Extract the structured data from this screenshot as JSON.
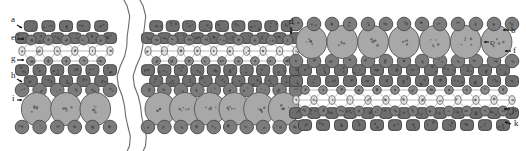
{
  "figure": {
    "width": 526,
    "height": 151,
    "background": "#ffffff"
  },
  "palette": {
    "dark_square": "#6e6e6e",
    "dark_square_stroke": "#3f3f3f",
    "medium_circle": "#7c7c7c",
    "medium_circle_stroke": "#4a4a4a",
    "large_circle": "#a8a8a8",
    "large_circle_stroke": "#555555",
    "light_ellipse": "#e4e4e4",
    "light_ellipse_stroke": "#6a6a6a",
    "small_circle": "#8a8a8a",
    "bond_line": "#8a8a8a",
    "break_line": "#6a6a6a",
    "label_text": "#1a1a1a",
    "leader": "#111111"
  },
  "labels": [
    {
      "id": "a",
      "text": "a",
      "x": 11,
      "y": 22,
      "lead_x1": 17,
      "lead_y1": 25,
      "lead_x2": 22,
      "lead_y2": 28,
      "side": "left"
    },
    {
      "id": "e",
      "text": "e",
      "x": 11,
      "y": 40,
      "lead_x1": 17,
      "lead_y1": 39,
      "lead_x2": 24,
      "lead_y2": 39,
      "side": "left"
    },
    {
      "id": "g",
      "text": "g",
      "x": 11,
      "y": 61,
      "lead_x1": 17,
      "lead_y1": 60,
      "lead_x2": 24,
      "lead_y2": 60,
      "side": "left"
    },
    {
      "id": "h",
      "text": "h",
      "x": 11,
      "y": 78,
      "lead_x1": 17,
      "lead_y1": 79,
      "lead_x2": 22,
      "lead_y2": 82,
      "side": "left"
    },
    {
      "id": "i",
      "text": "i",
      "x": 12,
      "y": 101,
      "lead_x1": 17,
      "lead_y1": 100,
      "lead_x2": 22,
      "lead_y2": 100,
      "side": "left"
    },
    {
      "id": "d",
      "text": "d",
      "x": 289,
      "y": 24,
      "lead_x1": 291,
      "lead_y1": 27,
      "lead_x2": 291,
      "lead_y2": 34,
      "side": "top"
    },
    {
      "id": "b",
      "text": "b",
      "x": 511,
      "y": 33,
      "lead_x1": 509,
      "lead_y1": 30,
      "lead_x2": 503,
      "lead_y2": 30,
      "side": "right"
    },
    {
      "id": "c",
      "text": "c",
      "x": 490,
      "y": 45,
      "lead_x1": 489,
      "lead_y1": 42,
      "lead_x2": 484,
      "lead_y2": 42,
      "side": "right"
    },
    {
      "id": "f",
      "text": "f",
      "x": 513,
      "y": 53,
      "lead_x1": 511,
      "lead_y1": 51,
      "lead_x2": 505,
      "lead_y2": 51,
      "side": "right"
    },
    {
      "id": "j",
      "text": "j",
      "x": 512,
      "y": 112,
      "lead_x1": 510,
      "lead_y1": 109,
      "lead_x2": 504,
      "lead_y2": 109,
      "side": "right"
    },
    {
      "id": "k",
      "text": "k",
      "x": 514,
      "y": 126,
      "lead_x1": 511,
      "lead_y1": 124,
      "lead_x2": 505,
      "lead_y2": 122,
      "side": "right"
    }
  ],
  "sections": [
    {
      "id": "left-panel",
      "x0": 22,
      "x1": 110,
      "orientation": "normal",
      "columns": 5
    },
    {
      "id": "middle-panel",
      "x0": 148,
      "x1": 296,
      "orientation": "normal",
      "columns": 9
    },
    {
      "id": "right-panel",
      "x0": 296,
      "x1": 512,
      "orientation": "flipped",
      "columns": 12
    }
  ],
  "break_lines": [
    {
      "id": "break-left",
      "x": 124
    },
    {
      "id": "break-right",
      "x": 140
    }
  ],
  "layers_normal": [
    {
      "id": "layer-a",
      "role": "top-square-row",
      "shape": "rounded-square",
      "y": 26,
      "size": 13,
      "fill_key": "dark_square",
      "stagger": "half"
    },
    {
      "id": "layer-a2",
      "role": "second-square-row",
      "shape": "rounded-square",
      "y": 38,
      "size": 13,
      "fill_key": "dark_square",
      "stagger": "none"
    },
    {
      "id": "layer-e",
      "role": "medium-circle-row",
      "shape": "circle",
      "y": 40,
      "size": 8,
      "fill_key": "medium_circle",
      "stagger": "half"
    },
    {
      "id": "layer-f",
      "role": "light-ellipse-row",
      "shape": "ellipse",
      "y": 51,
      "size": 8,
      "fill_key": "light_ellipse",
      "stagger": "none"
    },
    {
      "id": "layer-g",
      "role": "small-circle-row",
      "shape": "circle",
      "y": 61,
      "size": 7,
      "fill_key": "small_circle",
      "stagger": "half"
    },
    {
      "id": "layer-h",
      "role": "lower-square-row",
      "shape": "rounded-square",
      "y": 70,
      "size": 13,
      "fill_key": "dark_square",
      "stagger": "none"
    },
    {
      "id": "layer-h2",
      "role": "lower-square-row-2",
      "shape": "rounded-square",
      "y": 81,
      "size": 13,
      "fill_key": "dark_square",
      "stagger": "half"
    },
    {
      "id": "layer-i",
      "role": "medium-circle-row-2",
      "shape": "circle",
      "y": 90,
      "size": 11,
      "fill_key": "medium_circle",
      "stagger": "none"
    },
    {
      "id": "layer-j",
      "role": "large-circle-row",
      "shape": "large-ellipse",
      "y": 109,
      "size": 17,
      "fill_key": "large_circle",
      "stagger": "half"
    },
    {
      "id": "layer-k",
      "role": "bottom-circle-row",
      "shape": "circle",
      "y": 127,
      "size": 11,
      "fill_key": "medium_circle",
      "stagger": "none"
    }
  ],
  "annotations": {
    "caption": "",
    "notes": ""
  }
}
